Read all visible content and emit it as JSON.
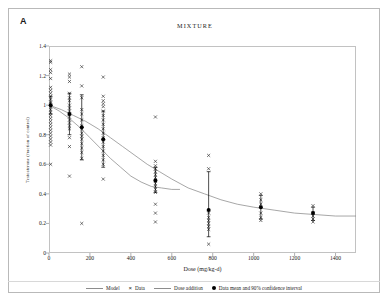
{
  "panel": {
    "label": "A"
  },
  "chart_data": {
    "type": "scatter",
    "title": "MIXTURE",
    "xlabel": "Dose (mg/kg-d)",
    "ylabel": "Testosterone (fraction of control)",
    "xlim": [
      0,
      1500
    ],
    "ylim": [
      0,
      1.4
    ],
    "xticks": [
      0,
      200,
      400,
      600,
      800,
      1000,
      1200,
      1400
    ],
    "yticks": [
      "0",
      "0.2",
      "0.4",
      "0.6",
      "0.8",
      "1",
      "1.2",
      "1.4"
    ],
    "grid": false,
    "legend_position": "bottom",
    "legend": [
      {
        "key": "model",
        "label": "Model",
        "marker": "line"
      },
      {
        "key": "data",
        "label": "Data",
        "marker": "x"
      },
      {
        "key": "dose_addition",
        "label": "Dose addition",
        "marker": "line"
      },
      {
        "key": "mean_ci",
        "label": "Data mean and 90% confidence interval",
        "marker": "dot"
      }
    ],
    "series": [
      {
        "name": "Data",
        "type": "scatter",
        "marker": "x",
        "points": [
          [
            8,
            1.3
          ],
          [
            8,
            1.29
          ],
          [
            8,
            1.24
          ],
          [
            8,
            1.22
          ],
          [
            8,
            1.18
          ],
          [
            8,
            1.12
          ],
          [
            8,
            1.1
          ],
          [
            8,
            1.08
          ],
          [
            8,
            1.06
          ],
          [
            8,
            1.04
          ],
          [
            8,
            1.02
          ],
          [
            8,
            1.01
          ],
          [
            8,
            0.99
          ],
          [
            8,
            0.97
          ],
          [
            8,
            0.95
          ],
          [
            8,
            0.93
          ],
          [
            8,
            0.91
          ],
          [
            8,
            0.89
          ],
          [
            8,
            0.87
          ],
          [
            8,
            0.85
          ],
          [
            8,
            0.83
          ],
          [
            8,
            0.81
          ],
          [
            8,
            0.79
          ],
          [
            8,
            0.77
          ],
          [
            8,
            0.75
          ],
          [
            8,
            0.73
          ],
          [
            8,
            0.6
          ],
          [
            100,
            1.21
          ],
          [
            100,
            1.19
          ],
          [
            100,
            1.16
          ],
          [
            100,
            1.08
          ],
          [
            100,
            1.05
          ],
          [
            100,
            1.03
          ],
          [
            100,
            1.0
          ],
          [
            100,
            0.98
          ],
          [
            100,
            0.96
          ],
          [
            100,
            0.94
          ],
          [
            100,
            0.92
          ],
          [
            100,
            0.9
          ],
          [
            100,
            0.88
          ],
          [
            100,
            0.86
          ],
          [
            100,
            0.84
          ],
          [
            100,
            0.78
          ],
          [
            100,
            0.72
          ],
          [
            100,
            0.52
          ],
          [
            160,
            1.26
          ],
          [
            160,
            1.13
          ],
          [
            160,
            1.05
          ],
          [
            160,
            0.97
          ],
          [
            160,
            0.94
          ],
          [
            160,
            0.9
          ],
          [
            160,
            0.86
          ],
          [
            160,
            0.84
          ],
          [
            160,
            0.81
          ],
          [
            160,
            0.79
          ],
          [
            160,
            0.77
          ],
          [
            160,
            0.74
          ],
          [
            160,
            0.71
          ],
          [
            160,
            0.68
          ],
          [
            160,
            0.64
          ],
          [
            160,
            0.2
          ],
          [
            265,
            1.19
          ],
          [
            265,
            1.06
          ],
          [
            265,
            1.03
          ],
          [
            265,
            1.01
          ],
          [
            265,
            0.99
          ],
          [
            265,
            0.96
          ],
          [
            265,
            0.93
          ],
          [
            265,
            0.9
          ],
          [
            265,
            0.87
          ],
          [
            265,
            0.84
          ],
          [
            265,
            0.81
          ],
          [
            265,
            0.78
          ],
          [
            265,
            0.75
          ],
          [
            265,
            0.72
          ],
          [
            265,
            0.69
          ],
          [
            265,
            0.66
          ],
          [
            265,
            0.63
          ],
          [
            265,
            0.6
          ],
          [
            265,
            0.5
          ],
          [
            520,
            0.92
          ],
          [
            520,
            0.62
          ],
          [
            520,
            0.59
          ],
          [
            520,
            0.57
          ],
          [
            520,
            0.55
          ],
          [
            520,
            0.53
          ],
          [
            520,
            0.51
          ],
          [
            520,
            0.49
          ],
          [
            520,
            0.47
          ],
          [
            520,
            0.45
          ],
          [
            520,
            0.43
          ],
          [
            520,
            0.41
          ],
          [
            520,
            0.33
          ],
          [
            520,
            0.27
          ],
          [
            520,
            0.21
          ],
          [
            780,
            0.66
          ],
          [
            780,
            0.57
          ],
          [
            780,
            0.27
          ],
          [
            780,
            0.24
          ],
          [
            780,
            0.22
          ],
          [
            780,
            0.2
          ],
          [
            780,
            0.18
          ],
          [
            780,
            0.16
          ],
          [
            780,
            0.06
          ],
          [
            1035,
            0.4
          ],
          [
            1035,
            0.36
          ],
          [
            1035,
            0.33
          ],
          [
            1035,
            0.27
          ],
          [
            1035,
            0.24
          ],
          [
            1035,
            0.22
          ],
          [
            1290,
            0.32
          ],
          [
            1290,
            0.27
          ],
          [
            1290,
            0.25
          ],
          [
            1290,
            0.23
          ],
          [
            1290,
            0.21
          ]
        ]
      },
      {
        "name": "Data mean and 90% confidence interval",
        "type": "errorbar",
        "marker": "dot",
        "points": [
          {
            "x": 8,
            "mean": 1.0,
            "low": 0.94,
            "high": 1.06
          },
          {
            "x": 100,
            "mean": 0.94,
            "low": 0.8,
            "high": 1.08
          },
          {
            "x": 160,
            "mean": 0.85,
            "low": 0.63,
            "high": 1.07
          },
          {
            "x": 265,
            "mean": 0.77,
            "low": 0.58,
            "high": 0.96
          },
          {
            "x": 520,
            "mean": 0.49,
            "low": 0.41,
            "high": 0.58
          },
          {
            "x": 780,
            "mean": 0.29,
            "low": 0.11,
            "high": 0.55
          },
          {
            "x": 1035,
            "mean": 0.31,
            "low": 0.23,
            "high": 0.39
          },
          {
            "x": 1290,
            "mean": 0.27,
            "low": 0.22,
            "high": 0.31
          }
        ]
      },
      {
        "name": "Model",
        "type": "line",
        "points": [
          [
            0,
            1.0
          ],
          [
            60,
            0.97
          ],
          [
            120,
            0.93
          ],
          [
            180,
            0.89
          ],
          [
            240,
            0.84
          ],
          [
            300,
            0.78
          ],
          [
            360,
            0.72
          ],
          [
            420,
            0.66
          ],
          [
            480,
            0.6
          ],
          [
            540,
            0.55
          ],
          [
            600,
            0.5
          ],
          [
            680,
            0.44
          ],
          [
            760,
            0.4
          ],
          [
            840,
            0.36
          ],
          [
            920,
            0.33
          ],
          [
            1000,
            0.31
          ],
          [
            1100,
            0.29
          ],
          [
            1200,
            0.27
          ],
          [
            1300,
            0.26
          ],
          [
            1400,
            0.25
          ],
          [
            1500,
            0.25
          ]
        ]
      },
      {
        "name": "Dose addition",
        "type": "line",
        "points": [
          [
            0,
            1.0
          ],
          [
            50,
            0.96
          ],
          [
            100,
            0.91
          ],
          [
            150,
            0.85
          ],
          [
            200,
            0.78
          ],
          [
            250,
            0.71
          ],
          [
            300,
            0.64
          ],
          [
            350,
            0.58
          ],
          [
            400,
            0.52
          ],
          [
            450,
            0.48
          ],
          [
            500,
            0.45
          ],
          [
            550,
            0.44
          ],
          [
            600,
            0.43
          ],
          [
            640,
            0.43
          ]
        ]
      }
    ]
  }
}
